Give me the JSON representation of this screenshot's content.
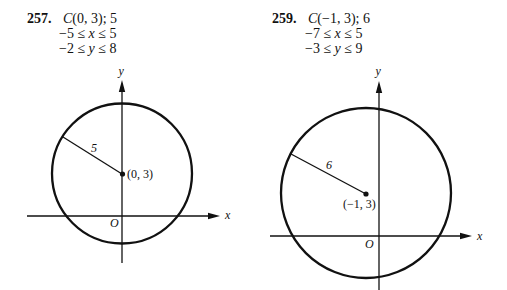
{
  "problems": [
    {
      "number": "257.",
      "center_radius": {
        "letter": "C",
        "rest": "(0, 3); 5"
      },
      "x_range": {
        "left": "−5 ≤ ",
        "var": "x",
        "right": " ≤ 5"
      },
      "y_range": {
        "left": "−2 ≤ ",
        "var": "y",
        "right": " ≤ 8"
      },
      "graph": {
        "x_axis_label": "x",
        "y_axis_label": "y",
        "origin_label": "O",
        "center_label": "(0, 3)",
        "radius_label": "5"
      }
    },
    {
      "number": "259.",
      "center_radius": {
        "letter": "C",
        "rest": "(−1, 3); 6"
      },
      "x_range": {
        "left": "−7 ≤ ",
        "var": "x",
        "right": " ≤ 5"
      },
      "y_range": {
        "left": "−3 ≤ ",
        "var": "y",
        "right": " ≤ 9"
      },
      "graph": {
        "x_axis_label": "x",
        "y_axis_label": "y",
        "origin_label": "O",
        "center_label": "(−1, 3)",
        "radius_label": "6"
      }
    }
  ],
  "colors": {
    "ink": "#111111",
    "background": "#ffffff"
  }
}
